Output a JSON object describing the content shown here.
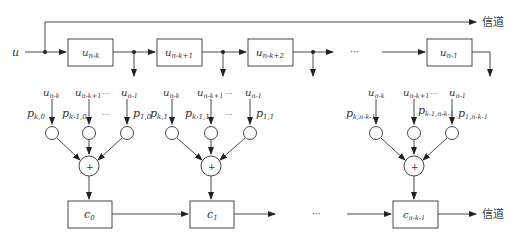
{
  "diagram": {
    "type": "systematic convolutional / cyclic encoder block diagram",
    "input_label": "u",
    "channel_label_top": "信道",
    "channel_label_bottom": "信道",
    "ellipsis": "···",
    "shift_register": [
      {
        "id": "reg-0",
        "label_main": "u",
        "label_sub": "n-k"
      },
      {
        "id": "reg-1",
        "label_main": "u",
        "label_sub": "n-k+1"
      },
      {
        "id": "reg-2",
        "label_main": "u",
        "label_sub": "n-k+2"
      },
      {
        "id": "reg-last",
        "label_main": "u",
        "label_sub": "n-1"
      }
    ],
    "parity_groups": [
      {
        "inputs": [
          {
            "u_main": "u",
            "u_sub": "n-k",
            "p_main": "p",
            "p_sub": "k,0"
          },
          {
            "u_main": "u",
            "u_sub": "n-k+1",
            "p_main": "p",
            "p_sub": "k-1,0"
          },
          {
            "u_main": "u",
            "u_sub": "n-1",
            "p_main": "p",
            "p_sub": "1,0"
          }
        ],
        "adder": "+",
        "output_main": "c",
        "output_sub": "0"
      },
      {
        "inputs": [
          {
            "u_main": "u",
            "u_sub": "n-k",
            "p_main": "p",
            "p_sub": "k,1"
          },
          {
            "u_main": "u",
            "u_sub": "n-k+1",
            "p_main": "p",
            "p_sub": "k-1,1"
          },
          {
            "u_main": "u",
            "u_sub": "n-1",
            "p_main": "p",
            "p_sub": "1,1"
          }
        ],
        "adder": "+",
        "output_main": "c",
        "output_sub": "1"
      },
      {
        "inputs": [
          {
            "u_main": "u",
            "u_sub": "n-k",
            "p_main": "p",
            "p_sub": "k,n-k-1"
          },
          {
            "u_main": "u",
            "u_sub": "n-k+1",
            "p_main": "p",
            "p_sub": "k-1,n-k-1"
          },
          {
            "u_main": "u",
            "u_sub": "n-1",
            "p_main": "p",
            "p_sub": "1,n-k-1"
          }
        ],
        "adder": "+",
        "output_main": "c",
        "output_sub": "n-k-1"
      }
    ]
  }
}
